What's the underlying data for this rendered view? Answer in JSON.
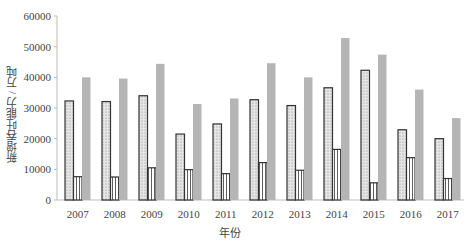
{
  "chart_data": {
    "type": "bar",
    "title": "",
    "xlabel": "年份",
    "ylabel": "新增吞吐能力 / 万吨",
    "ylim": [
      0,
      60000
    ],
    "yticks": [
      0,
      10000,
      20000,
      30000,
      40000,
      50000,
      60000
    ],
    "grid": false,
    "legend": "none",
    "categories": [
      "2007",
      "2008",
      "2009",
      "2010",
      "2011",
      "2012",
      "2013",
      "2014",
      "2015",
      "2016",
      "2017"
    ],
    "series": [
      {
        "name": "series-dotted",
        "pattern": "dotted",
        "values": [
          32300,
          32100,
          34000,
          21500,
          24800,
          32700,
          30800,
          36600,
          42300,
          22900,
          20000
        ]
      },
      {
        "name": "series-vertical-lines",
        "pattern": "vertical-lines",
        "values": [
          7600,
          7500,
          10500,
          9900,
          8600,
          12200,
          9700,
          16500,
          5600,
          13800,
          7000
        ]
      },
      {
        "name": "series-gray",
        "pattern": "solid-gray",
        "values": [
          40000,
          39600,
          44400,
          31300,
          33100,
          44600,
          40000,
          52800,
          47400,
          36000,
          26700
        ]
      }
    ],
    "colors": {
      "gray_bar": "#b5b5b5",
      "dotted_fill": "#d8d8d8",
      "outline": "#333333",
      "axis": "#bbbbbb"
    }
  }
}
